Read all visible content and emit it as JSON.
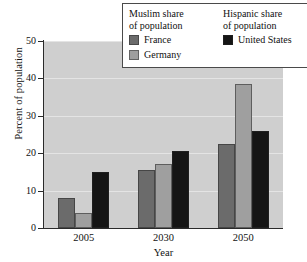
{
  "chart_data": {
    "type": "bar",
    "title": "",
    "subtitle": "",
    "xlabel": "Year",
    "ylabel": "Percent of population",
    "categories": [
      "2005",
      "2030",
      "2050"
    ],
    "ylim": [
      0,
      50
    ],
    "yticks": [
      0,
      10,
      20,
      30,
      40,
      50
    ],
    "ytick_labels": [
      "0",
      "10",
      "20",
      "30",
      "40",
      "50"
    ],
    "grid": true,
    "legend_position": "top-right",
    "series": [
      {
        "name": "France",
        "group": "Muslim share of population",
        "color": "#6b6b6b",
        "values": [
          8,
          15.5,
          22.5
        ]
      },
      {
        "name": "Germany",
        "group": "Muslim share of population",
        "color": "#9f9f9f",
        "values": [
          4,
          17,
          38.5
        ]
      },
      {
        "name": "United States",
        "group": "Hispanic share of population",
        "color": "#151515",
        "values": [
          15,
          20.5,
          26
        ]
      }
    ],
    "plot_background": "#cfcfcf",
    "gridline_color": "#e4e4e4",
    "axis_color": "#2a2a2a"
  },
  "legend": {
    "columns": [
      {
        "heading_line1": "Muslim share",
        "heading_line2": "of population",
        "entries": [
          {
            "label": "France",
            "color": "#6b6b6b"
          },
          {
            "label": "Germany",
            "color": "#9f9f9f"
          }
        ]
      },
      {
        "heading_line1": "Hispanic share",
        "heading_line2": "of population",
        "entries": [
          {
            "label": "United States",
            "color": "#151515"
          }
        ]
      }
    ]
  }
}
